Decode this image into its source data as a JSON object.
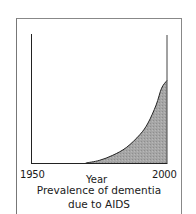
{
  "chart_data": {
    "type": "area",
    "title": "Prevalence of dementia due to AIDS",
    "title_lines": [
      "Prevalence of dementia",
      "due to AIDS"
    ],
    "xlabel": "Year",
    "ylabel": "",
    "x_tick_labels": [
      "1950",
      "2000"
    ],
    "xlim": [
      1950,
      2000
    ],
    "ylim": [
      0,
      1
    ],
    "grid": false,
    "legend": null,
    "fill_color": "#a3a3a3",
    "line_color": "#222222",
    "x": [
      1970,
      1975,
      1980,
      1985,
      1990,
      1993,
      1996,
      1998,
      2000
    ],
    "values": [
      0.0,
      0.02,
      0.06,
      0.12,
      0.22,
      0.31,
      0.45,
      0.58,
      0.64
    ]
  },
  "labels": {
    "x_min": "1950",
    "x_max": "2000",
    "xlabel": "Year",
    "title_line1": "Prevalence of dementia",
    "title_line2": "due to AIDS"
  }
}
